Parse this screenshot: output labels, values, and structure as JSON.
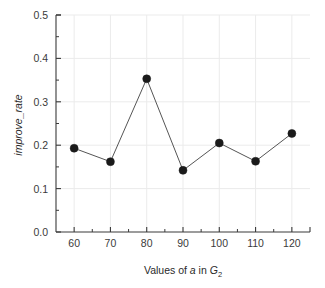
{
  "chart_data": {
    "type": "line",
    "title": "",
    "subtitle": "",
    "xlabel_parts": {
      "prefix": "Values of ",
      "italic_var": "a",
      "middle": " in ",
      "italic_group": "G",
      "subscript": "2"
    },
    "xlabel": "Values of a in G2",
    "ylabel": "improve_rate",
    "categories": [
      60,
      70,
      80,
      90,
      100,
      110,
      120
    ],
    "x": [
      60,
      70,
      80,
      90,
      100,
      110,
      120
    ],
    "values": [
      0.193,
      0.162,
      0.353,
      0.142,
      0.205,
      0.163,
      0.227
    ],
    "series": [
      {
        "name": "improve_rate",
        "values": [
          0.193,
          0.162,
          0.353,
          0.142,
          0.205,
          0.163,
          0.227
        ]
      }
    ],
    "xlim": [
      55,
      125
    ],
    "ylim": [
      0.0,
      0.5
    ],
    "x_ticks": [
      60,
      70,
      80,
      90,
      100,
      110,
      120
    ],
    "x_tick_labels": [
      "60",
      "70",
      "80",
      "90",
      "100",
      "110",
      "120"
    ],
    "x_minor_ticks": [
      65,
      75,
      85,
      95,
      105,
      115
    ],
    "y_ticks": [
      0.0,
      0.1,
      0.2,
      0.3,
      0.4,
      0.5
    ],
    "y_tick_labels": [
      "0.0",
      "0.1",
      "0.2",
      "0.3",
      "0.4",
      "0.5"
    ],
    "y_minor_ticks": [
      0.05,
      0.15,
      0.25,
      0.35,
      0.45
    ],
    "grid": true,
    "grid_color": "#ebebeb",
    "legend": false,
    "legend_position": "none",
    "line_color": "#555555",
    "marker_color": "#1a1a1a",
    "marker_shape": "circle",
    "marker_size": 4,
    "axis_color": "#3a3a3a",
    "background_color": "#ffffff",
    "annotations": []
  }
}
